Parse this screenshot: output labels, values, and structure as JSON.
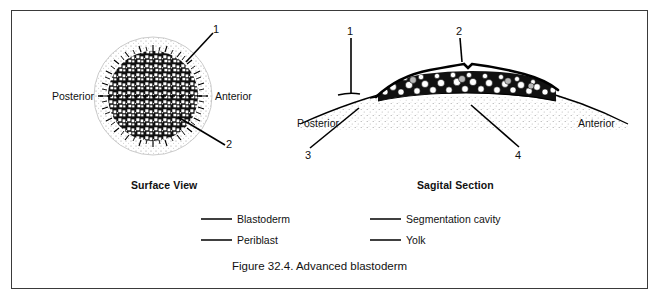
{
  "figure": {
    "caption": "Figure 32.4. Advanced blastoderm",
    "panels": [
      {
        "id": "surface-view",
        "title": "Surface View",
        "axis_labels": {
          "left": "Posterior",
          "right": "Anterior"
        },
        "callouts": [
          {
            "number": "1",
            "target": "outer margin of blastoderm"
          },
          {
            "number": "2",
            "target": "central cellular blastoderm"
          }
        ]
      },
      {
        "id": "sagital-section",
        "title": "Sagital Section",
        "axis_labels": {
          "left": "Posterior",
          "right": "Anterior"
        },
        "callouts": [
          {
            "number": "1",
            "target": "blastoderm edge"
          },
          {
            "number": "2",
            "target": "upper surface layer"
          },
          {
            "number": "3",
            "target": "yolk mass"
          },
          {
            "number": "4",
            "target": "segmentation cavity"
          }
        ]
      }
    ],
    "legend": {
      "columns": [
        {
          "items": [
            {
              "blank": "",
              "label": "Blastoderm"
            },
            {
              "blank": "",
              "label": "Periblast"
            }
          ]
        },
        {
          "items": [
            {
              "blank": "",
              "label": "Segmentation cavity"
            },
            {
              "blank": "",
              "label": "Yolk"
            }
          ]
        }
      ]
    },
    "colors": {
      "ink": "#000000",
      "border": "#3a3a3a",
      "background": "#ffffff",
      "stipple": "#8a8a8a"
    }
  }
}
